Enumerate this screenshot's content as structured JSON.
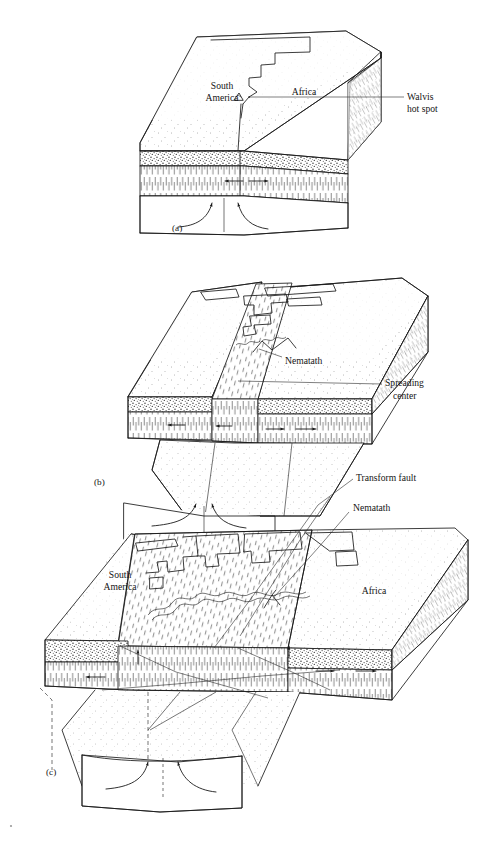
{
  "figure": {
    "background_color": "#ffffff",
    "ink_color": "#1a1a1a",
    "panel_count": 3
  },
  "panels": [
    {
      "id": "a",
      "key": "(a)",
      "caption_text": "(a)",
      "stage": "pre-rift: South America and Africa joined over the Walvis hot spot",
      "labels": [
        {
          "name": "south-america",
          "text": "South\nAmerica",
          "lines": [
            "South",
            "America"
          ]
        },
        {
          "name": "africa",
          "text": "Africa",
          "lines": [
            "Africa"
          ]
        },
        {
          "name": "walvis-hot-spot",
          "text": "Walvis\nhot spot",
          "lines": [
            "Walvis",
            "hot spot"
          ]
        }
      ]
    },
    {
      "id": "b",
      "key": "(b)",
      "caption_text": "(b)",
      "stage": "early rifting: spreading center forms, nematath begins to build",
      "labels": [
        {
          "name": "nematath",
          "text": "Nematath",
          "lines": [
            "Nematath"
          ]
        },
        {
          "name": "spreading-center",
          "text": "Spreading\ncenter",
          "lines": [
            "Spreading",
            "center"
          ]
        }
      ]
    },
    {
      "id": "c",
      "key": "(c)",
      "caption_text": "(c)",
      "stage": "advanced spreading: wide ocean floor with transform faults and nematath ridge",
      "labels": [
        {
          "name": "south-america",
          "text": "South\nAmerica",
          "lines": [
            "South",
            "America"
          ]
        },
        {
          "name": "africa",
          "text": "Africa",
          "lines": [
            "Africa"
          ]
        },
        {
          "name": "transform-fault",
          "text": "Transform fault",
          "lines": [
            "Transform fault"
          ]
        },
        {
          "name": "nematath",
          "text": "Nematath",
          "lines": [
            "Nematath"
          ]
        }
      ]
    }
  ],
  "text": {
    "south_america_line1": "South",
    "south_america_line2": "America",
    "africa": "Africa",
    "walvis_line1": "Walvis",
    "walvis_line2": "hot spot",
    "nematath": "Nematath",
    "spreading_line1": "Spreading",
    "spreading_line2": "center",
    "transform_fault": "Transform fault",
    "panel_a": "(a)",
    "panel_b": "(b)",
    "panel_c": "(c)"
  },
  "legend_materials": [
    {
      "name": "continental-crust",
      "pattern": "fine-stipple",
      "description": "sparse dotted top surface of continental plate"
    },
    {
      "name": "oceanic-crust-band",
      "pattern": "dense-stipple",
      "description": "dense coarse stipple band beneath the surface"
    },
    {
      "name": "lithospheric-mantle",
      "pattern": "vertical-hatch",
      "description": "short vertical dash hatching layer"
    },
    {
      "name": "new-seafloor",
      "pattern": "slanted-dash",
      "description": "slanted dashes marking newly created ocean floor"
    },
    {
      "name": "asthenosphere",
      "pattern": "sparse-stipple",
      "description": "lightly stippled lower block with upwelling arrows"
    }
  ]
}
